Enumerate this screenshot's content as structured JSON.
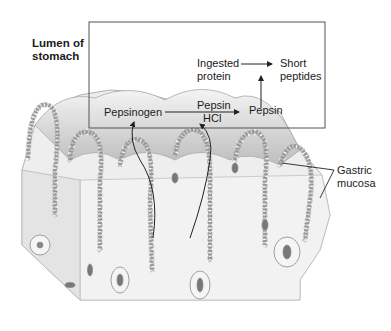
{
  "diagram": {
    "region_label": {
      "line1": "Lumen of",
      "line2": "stomach"
    },
    "tissue_label": {
      "line1": "Gastric",
      "line2": "mucosa"
    },
    "nodes": {
      "pepsinogen": "Pepsinogen",
      "pepsin_catalyst": "Pepsin",
      "hcl_catalyst": "HCl",
      "pepsin_product": "Pepsin",
      "ingested_protein": {
        "line1": "Ingested",
        "line2": "protein"
      },
      "short_peptides": {
        "line1": "Short",
        "line2": "peptides"
      }
    },
    "edges": [
      {
        "from": "Pepsinogen",
        "to": "Pepsin",
        "via": [
          "Pepsin",
          "HCl"
        ]
      },
      {
        "from": "Ingested protein",
        "to": "Short peptides",
        "via": [
          "Pepsin"
        ]
      },
      {
        "from": "gastric gland (chief cells)",
        "to": "Pepsinogen",
        "type": "secretion-curve"
      },
      {
        "from": "gastric gland (parietal cells)",
        "to": "HCl",
        "type": "secretion-curve"
      }
    ],
    "colors": {
      "line": "#222222",
      "box": "#555555",
      "tissue_fill": "#ececec",
      "tissue_shade": "#cfcfcf",
      "cell": "#f7f7f7",
      "cell_stroke": "#8a8a8a"
    }
  }
}
